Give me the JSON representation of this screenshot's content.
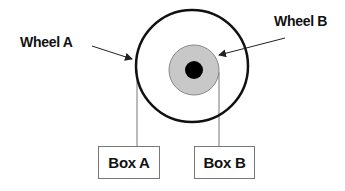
{
  "labels": {
    "wheel_a": "Wheel A",
    "wheel_b": "Wheel B"
  },
  "boxes": {
    "box_a": "Box A",
    "box_b": "Box B"
  },
  "colors": {
    "outer_ring": "#111111",
    "inner_disc": "#c8c8c8",
    "hub": "#000000",
    "connector": "#777777"
  }
}
